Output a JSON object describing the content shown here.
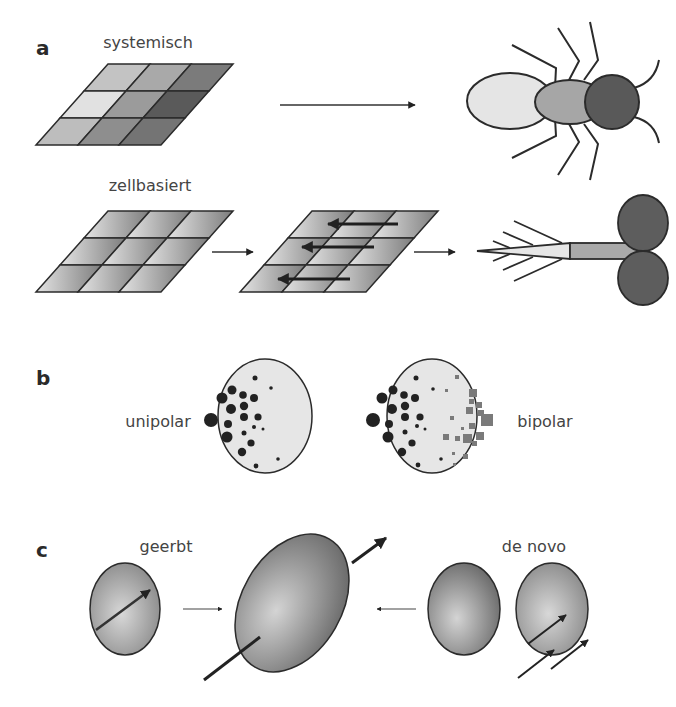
{
  "panels": {
    "a": {
      "label": "a",
      "row1_title": "systemisch",
      "row2_title": "zellbasiert"
    },
    "b": {
      "label": "b",
      "left_caption": "unipolar",
      "right_caption": "bipolar"
    },
    "c": {
      "label": "c",
      "left_caption": "geerbt",
      "right_caption": "de novo"
    }
  },
  "colors": {
    "outline": "#2b2b2b",
    "light_fill": "#e6e6e6",
    "mid_fill": "#a8a8a8",
    "dark_fill": "#5a5a5a",
    "dot_fill": "#222222",
    "square_fill": "#7a7a7a"
  }
}
